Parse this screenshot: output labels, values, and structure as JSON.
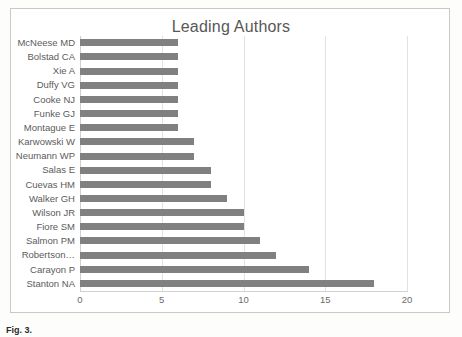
{
  "chart_data": {
    "type": "bar",
    "orientation": "horizontal",
    "title": "Leading Authors",
    "xlabel": "",
    "ylabel": "",
    "xlim": [
      0,
      20
    ],
    "xticks": [
      "0",
      "5",
      "10",
      "15",
      "20"
    ],
    "grid": "vertical",
    "legend": "none",
    "bar_color": "#808080",
    "categories": [
      "McNeese MD",
      "Bolstad CA",
      "Xie A",
      "Duffy VG",
      "Cooke NJ",
      "Funke GJ",
      "Montague E",
      "Karwowski W",
      "Neumann WP",
      "Salas E",
      "Cuevas HM",
      "Walker GH",
      "Wilson JR",
      "Fiore SM",
      "Salmon PM",
      "Robertson…",
      "Carayon P",
      "Stanton NA"
    ],
    "values": [
      6,
      6,
      6,
      6,
      6,
      6,
      6,
      7,
      7,
      8,
      8,
      9,
      10,
      10,
      11,
      12,
      14,
      18
    ]
  },
  "caption": {
    "label": "Fig. 3.",
    "text": ""
  }
}
